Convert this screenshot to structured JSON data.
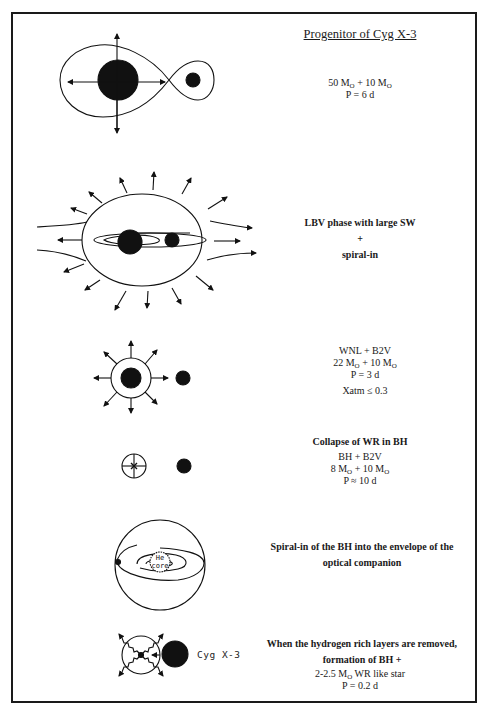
{
  "title": "Progenitor of Cyg X-3",
  "mass_unit_symbol": "M",
  "mass_unit_sub": "O",
  "stages": [
    {
      "id": "progenitor",
      "lines": [
        {
          "a": "50",
          "b": "10",
          "text_after": ""
        },
        {
          "text": "P = 6 d"
        }
      ],
      "masses": {
        "primary": "50",
        "secondary": "10"
      },
      "period": "P = 6 d"
    },
    {
      "id": "lbv-phase",
      "heading": "LBV phase with large SW",
      "plus": "+",
      "subheading": "spiral-in"
    },
    {
      "id": "wnl-b2v",
      "system": "WNL + B2V",
      "masses": {
        "primary": "22",
        "secondary": "10"
      },
      "period": "P = 3 d",
      "extra": "Xatm ≤ 0.3"
    },
    {
      "id": "collapse",
      "heading": "Collapse of WR in BH",
      "system": "BH + B2V",
      "masses": {
        "primary": "8",
        "secondary": "10"
      },
      "period": "P ≈ 10 d"
    },
    {
      "id": "spiral-in-envelope",
      "heading_line1": "Spiral-in of the BH into the envelope of the",
      "heading_line2": "optical companion",
      "core_label_1": "He",
      "core_label_2": "core"
    },
    {
      "id": "final",
      "heading_line1": "When the hydrogen rich layers are removed,",
      "heading_line2": "formation of BH +",
      "mass_range": "2-2.5",
      "star_desc": "WR like star",
      "period": "P = 0.2 d",
      "object_label": "Cyg X-3"
    }
  ]
}
